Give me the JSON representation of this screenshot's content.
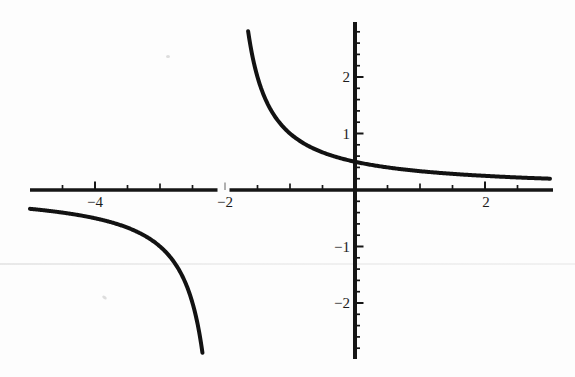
{
  "figure": {
    "background_color": "#fdfdfd",
    "ink_color": "#161616",
    "curve_color": "#121212",
    "faint_tick_color": "#8f8f8f"
  },
  "chart_data": {
    "type": "line",
    "title": "",
    "xlabel": "",
    "ylabel": "",
    "function": "y = 1/(x + 2)",
    "formula": {
      "kind": "reciprocal",
      "a": 1,
      "c": -2,
      "k": 0
    },
    "xlim": [
      -5,
      3
    ],
    "ylim": [
      -3,
      3
    ],
    "grid": false,
    "legend": false,
    "vertical_asymptote_x": -2,
    "horizontal_asymptote_y": 0,
    "x_axis": {
      "major_ticks": [
        -4,
        -2,
        2
      ],
      "tick_labels": [
        "−4",
        "−2",
        "2"
      ],
      "medium_ticks": [
        -3,
        -1,
        1
      ],
      "minor_step": 0.5,
      "minor_range": [
        -4.5,
        2.5
      ],
      "axis_gap_near": -2
    },
    "y_axis": {
      "major_ticks": [
        2,
        1,
        -1,
        -2
      ],
      "tick_labels": [
        "2",
        "1",
        "−1",
        "−2"
      ],
      "minor_step": 0.2,
      "minor_range": [
        -2.8,
        2.8
      ]
    },
    "branches": [
      {
        "name": "left",
        "x_start": -5,
        "x_end": -2.3472,
        "y_at_start": -0.333,
        "y_at_end": -2.88
      },
      {
        "name": "right",
        "x_start": -1.6441,
        "x_end": 3,
        "y_at_start": 2.81,
        "y_at_end": 0.2
      }
    ],
    "sample_points": {
      "left_branch": [
        [
          -5,
          -0.333
        ],
        [
          -4.5,
          -0.4
        ],
        [
          -4,
          -0.5
        ],
        [
          -3.5,
          -0.667
        ],
        [
          -3,
          -1
        ],
        [
          -2.75,
          -1.333
        ],
        [
          -2.5,
          -2
        ],
        [
          -2.4,
          -2.5
        ],
        [
          -2.35,
          -2.857
        ]
      ],
      "right_branch": [
        [
          -1.644,
          2.81
        ],
        [
          -1.5,
          2
        ],
        [
          -1.25,
          1.333
        ],
        [
          -1,
          1
        ],
        [
          -0.5,
          0.667
        ],
        [
          0,
          0.5
        ],
        [
          0.5,
          0.4
        ],
        [
          1,
          0.333
        ],
        [
          1.5,
          0.286
        ],
        [
          2,
          0.25
        ],
        [
          2.5,
          0.222
        ],
        [
          3,
          0.2
        ]
      ]
    }
  }
}
